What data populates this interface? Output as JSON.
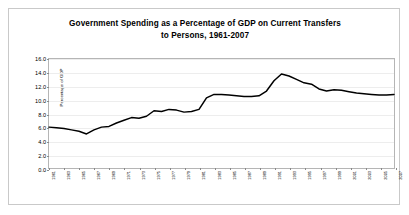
{
  "chart_data": {
    "type": "line",
    "title": "Government Spending as a Percentage of GDP on Current Transfers to Persons, 1961-2007",
    "title_line1": "Government Spending as a Percentage of GDP on Current Transfers",
    "title_line2": "to Persons, 1961-2007",
    "xlabel": "",
    "ylabel": "Percentage of GDP",
    "ylim": [
      0.0,
      16.0
    ],
    "ytick_labels": [
      "16.0",
      "14.0",
      "12.0",
      "10.0",
      "8.0",
      "6.0",
      "4.0",
      "2.0",
      "0.0"
    ],
    "ytick_values": [
      16.0,
      14.0,
      12.0,
      10.0,
      8.0,
      6.0,
      4.0,
      2.0,
      0.0
    ],
    "xlim": [
      1961,
      2007
    ],
    "grid": true,
    "grid_axis": "y",
    "legend": false,
    "line_color": "#000000",
    "xtick_labels": [
      "1961",
      "1963",
      "1965",
      "1967",
      "1969",
      "1971",
      "1973",
      "1975",
      "1977",
      "1979",
      "1981",
      "1983",
      "1985",
      "1987",
      "1989",
      "1991",
      "1993",
      "1995",
      "1997",
      "1999",
      "2001",
      "2003",
      "2005",
      "2007"
    ],
    "x": [
      1961,
      1962,
      1963,
      1964,
      1965,
      1966,
      1967,
      1968,
      1969,
      1970,
      1971,
      1972,
      1973,
      1974,
      1975,
      1976,
      1977,
      1978,
      1979,
      1980,
      1981,
      1982,
      1983,
      1984,
      1985,
      1986,
      1987,
      1988,
      1989,
      1990,
      1991,
      1992,
      1993,
      1994,
      1995,
      1996,
      1997,
      1998,
      1999,
      2000,
      2001,
      2002,
      2003,
      2004,
      2005,
      2006,
      2007
    ],
    "values": [
      6.0,
      5.9,
      5.8,
      5.6,
      5.4,
      5.0,
      5.6,
      6.0,
      6.1,
      6.6,
      7.0,
      7.4,
      7.3,
      7.6,
      8.4,
      8.3,
      8.6,
      8.5,
      8.2,
      8.3,
      8.6,
      10.3,
      10.8,
      10.8,
      10.7,
      10.6,
      10.5,
      10.5,
      10.6,
      11.3,
      12.8,
      13.8,
      13.5,
      13.0,
      12.5,
      12.3,
      11.6,
      11.3,
      11.5,
      11.4,
      11.2,
      11.0,
      10.9,
      10.8,
      10.7,
      10.7,
      10.8
    ],
    "series_name": "Current Transfers to Persons"
  }
}
